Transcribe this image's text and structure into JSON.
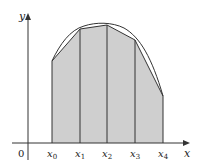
{
  "figure": {
    "type": "trapezoidal-rule-diagram",
    "axes": {
      "x_label": "x",
      "y_label": "y",
      "origin_label": "0"
    },
    "partition_labels": [
      {
        "base": "x",
        "sub": "0"
      },
      {
        "base": "x",
        "sub": "1"
      },
      {
        "base": "x",
        "sub": "2"
      },
      {
        "base": "x",
        "sub": "3"
      },
      {
        "base": "x",
        "sub": "4"
      }
    ],
    "colors": {
      "shade": "#cfcfcf",
      "line": "#333333",
      "curve": "#333333",
      "background": "#ffffff"
    }
  }
}
